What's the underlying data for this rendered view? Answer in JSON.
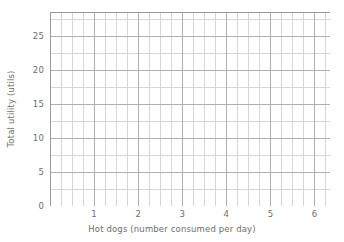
{
  "chart_data": {
    "type": "line",
    "title": "",
    "subtitle": "",
    "xlabel": "Hot dogs (number consumed per day)",
    "ylabel": "Total utility (utils)",
    "xlim": [
      0,
      6.35
    ],
    "ylim": [
      0,
      28.6
    ],
    "x_major_ticks": [
      1,
      2,
      3,
      4,
      5,
      6
    ],
    "x_major_tick_labels": [
      "1",
      "2",
      "3",
      "4",
      "5",
      "6"
    ],
    "x_minor_step": 0.25,
    "y_major_ticks": [
      0,
      5,
      10,
      15,
      20,
      25
    ],
    "y_major_tick_labels": [
      "0",
      "5",
      "10",
      "15",
      "20",
      "25"
    ],
    "y_minor_step": 2.5,
    "grid": true,
    "grid_major_color": "#b0b0b0",
    "grid_minor_color": "#d6d6d6",
    "axis_color": "#9a9a9a",
    "background_color": "#ffffff",
    "legend": [],
    "annotations": [],
    "series": [],
    "values": [],
    "categories": [],
    "note": "Empty plotting grid - no data plotted"
  },
  "axes": {
    "x_title": "Hot dogs (number consumed per day)",
    "y_title": "Total utility (utils)",
    "x_ticks": [
      "1",
      "2",
      "3",
      "4",
      "5",
      "6"
    ],
    "y_ticks": [
      "0",
      "5",
      "10",
      "15",
      "20",
      "25"
    ]
  }
}
